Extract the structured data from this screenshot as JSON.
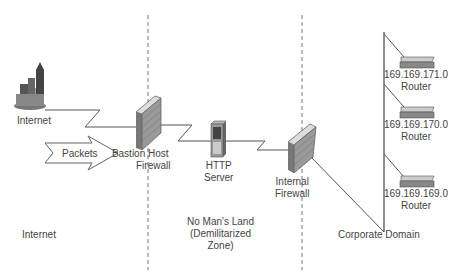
{
  "diagram": {
    "title": "",
    "zones": [
      {
        "id": "internet",
        "label": "Internet"
      },
      {
        "id": "dmz",
        "label_lines": [
          "No Man's Land",
          "(Demilitarized",
          "Zone)"
        ]
      },
      {
        "id": "corporate",
        "label": "Corporate Domain"
      }
    ],
    "nodes": {
      "internet": {
        "label": "Internet",
        "icon": "city-buildings-icon"
      },
      "packets": {
        "label": "Packets",
        "icon": "arrow-icon"
      },
      "bastion": {
        "label_lines": [
          "Bastion Host",
          "Firewall"
        ],
        "icon": "brick-wall-firewall-icon"
      },
      "http": {
        "label_lines": [
          "HTTP",
          "Server"
        ],
        "icon": "server-tower-icon"
      },
      "internal": {
        "label_lines": [
          "Internal",
          "Firewall"
        ],
        "icon": "brick-wall-firewall-icon"
      },
      "routers": [
        {
          "ip": "169.169.171.0",
          "label": "Router",
          "icon": "router-icon"
        },
        {
          "ip": "169.169.170.0",
          "label": "Router",
          "icon": "router-icon"
        },
        {
          "ip": "169.169.169.0",
          "label": "Router",
          "icon": "router-icon"
        }
      ]
    },
    "edges": [
      {
        "from": "internet",
        "to": "bastion",
        "style": "lightning"
      },
      {
        "from": "bastion",
        "to": "http",
        "style": "lightning"
      },
      {
        "from": "http",
        "to": "internal",
        "style": "lightning"
      },
      {
        "from": "internal",
        "to": "corporate-backbone",
        "style": "line"
      },
      {
        "from": "corporate-backbone",
        "to": "router-171",
        "style": "line"
      },
      {
        "from": "corporate-backbone",
        "to": "router-170",
        "style": "line"
      },
      {
        "from": "corporate-backbone",
        "to": "router-169",
        "style": "line"
      }
    ],
    "colors": {
      "line": "#555555",
      "dash": "#777777",
      "text": "#444444",
      "wall": "#8a8a8a"
    }
  }
}
